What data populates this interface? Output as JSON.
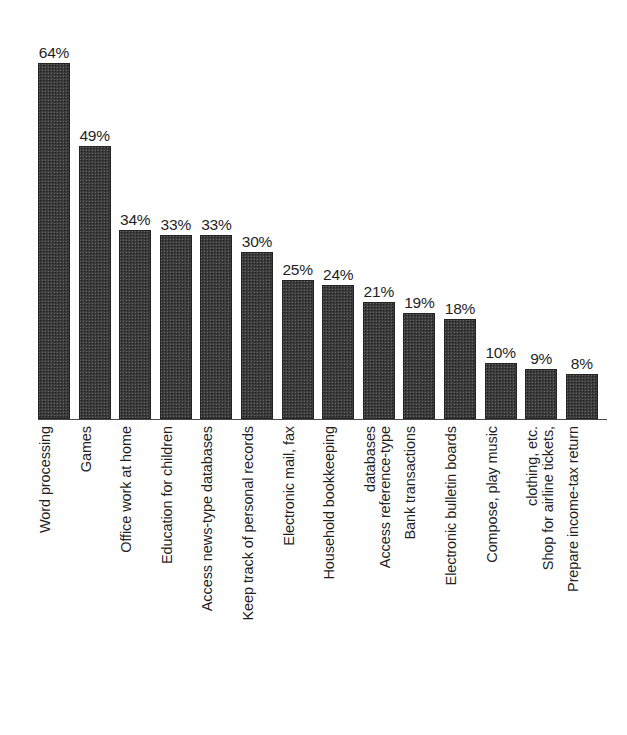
{
  "chart_data": {
    "type": "bar",
    "title": "",
    "subtitle": "",
    "xlabel": "",
    "ylabel": "",
    "ylim": [
      0,
      70
    ],
    "grid": false,
    "legend": null,
    "orientation": "vertical",
    "value_label_suffix": "%",
    "categories": [
      "Word processing",
      "Games",
      "Office work at home",
      "Education for children",
      "Access news-type databases",
      "Keep track of personal records",
      "Electronic mail, fax",
      "Household bookkeeping",
      "Access reference-type databases",
      "Bank transactions",
      "Electronic bulletin boards",
      "Compose, play music",
      "Shop for airline tickets, clothing, etc.",
      "Prepare income-tax return"
    ],
    "values": [
      64,
      49,
      34,
      33,
      33,
      30,
      25,
      24,
      21,
      19,
      18,
      10,
      9,
      8
    ],
    "value_labels": [
      "64%",
      "49%",
      "34%",
      "33%",
      "33%",
      "30%",
      "25%",
      "24%",
      "21%",
      "19%",
      "18%",
      "10%",
      "9%",
      "8%"
    ],
    "category_label_lines": [
      [
        "Word processing"
      ],
      [
        "Games"
      ],
      [
        "Office work at home"
      ],
      [
        "Education for children"
      ],
      [
        "Access news-type databases"
      ],
      [
        "Keep track of personal records"
      ],
      [
        "Electronic mail, fax"
      ],
      [
        "Household bookkeeping"
      ],
      [
        "Access reference-type",
        "databases"
      ],
      [
        "Bank transactions"
      ],
      [
        "Electronic bulletin boards"
      ],
      [
        "Compose, play music"
      ],
      [
        "Shop for airline tickets,",
        "clothing, etc."
      ],
      [
        "Prepare income-tax return"
      ]
    ]
  },
  "style": {
    "background": "#ffffff",
    "bar_fill": "#3c3c3c",
    "bar_border": "#232323",
    "axis_color": "#4a4a4a",
    "text_color": "#1f1f1f"
  }
}
